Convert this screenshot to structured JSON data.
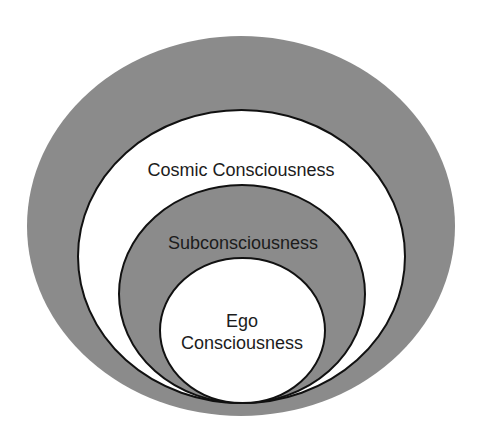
{
  "diagram": {
    "type": "nested-ellipses",
    "colors": {
      "background": "#ffffff",
      "gray_fill": "#8b8b8b",
      "white_fill": "#ffffff",
      "stroke": "#111111",
      "text": "#1c1c1c"
    },
    "layers": [
      {
        "id": "outer",
        "fill": "gray",
        "label": ""
      },
      {
        "id": "cosmic",
        "fill": "white",
        "label": "Cosmic Consciousness"
      },
      {
        "id": "subconscious",
        "fill": "gray",
        "label": "Subconsciousness"
      },
      {
        "id": "ego",
        "fill": "white",
        "label_line1": "Ego",
        "label_line2": "Consciousness"
      }
    ]
  }
}
